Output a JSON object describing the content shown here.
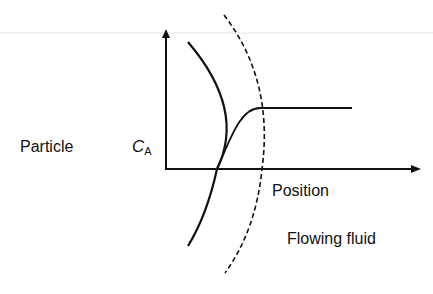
{
  "diagram": {
    "type": "concentration-profile-near-particle",
    "labels": {
      "particle": "Particle",
      "concentration_symbol": "C",
      "concentration_subscript": "A",
      "x_axis": "Position",
      "fluid": "Flowing fluid"
    },
    "elements": {
      "y_axis": "concentration C_A axis with upward arrow",
      "x_axis": "position axis with rightward arrow",
      "particle_surface": "solid curved arc",
      "boundary_layer_edge": "dashed curved arc",
      "profile_curve": "concentration rises from zero at particle surface to bulk value at boundary-layer edge, then constant"
    },
    "colors": {
      "line": "#111111",
      "background": "#ffffff",
      "top_rule": "#e6e6e6"
    }
  }
}
